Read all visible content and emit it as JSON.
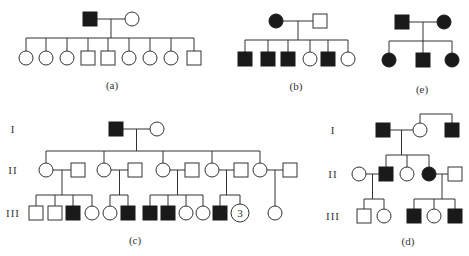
{
  "figure": {
    "panels": [
      {
        "id": "a",
        "label": "(a)",
        "generations": [
          {
            "label": "",
            "individuals": [
              {
                "sex": "male",
                "affected": true
              },
              {
                "sex": "female",
                "affected": false
              }
            ]
          },
          {
            "label": "",
            "individuals": [
              {
                "sex": "female",
                "affected": false
              },
              {
                "sex": "female",
                "affected": false
              },
              {
                "sex": "female",
                "affected": false
              },
              {
                "sex": "male",
                "affected": false
              },
              {
                "sex": "male",
                "affected": false
              },
              {
                "sex": "female",
                "affected": false
              },
              {
                "sex": "female",
                "affected": false
              },
              {
                "sex": "female",
                "affected": false
              },
              {
                "sex": "male",
                "affected": false
              }
            ]
          }
        ]
      },
      {
        "id": "b",
        "label": "(b)",
        "generations": [
          {
            "label": "",
            "individuals": [
              {
                "sex": "female",
                "affected": true
              },
              {
                "sex": "male",
                "affected": false
              }
            ]
          },
          {
            "label": "",
            "individuals": [
              {
                "sex": "male",
                "affected": true
              },
              {
                "sex": "male",
                "affected": true
              },
              {
                "sex": "male",
                "affected": true
              },
              {
                "sex": "female",
                "affected": false
              },
              {
                "sex": "male",
                "affected": true
              },
              {
                "sex": "female",
                "affected": false
              }
            ]
          }
        ]
      },
      {
        "id": "e",
        "label": "(e)",
        "generations": [
          {
            "label": "",
            "individuals": [
              {
                "sex": "male",
                "affected": true
              },
              {
                "sex": "female",
                "affected": true
              }
            ]
          },
          {
            "label": "",
            "individuals": [
              {
                "sex": "female",
                "affected": true
              },
              {
                "sex": "male",
                "affected": true
              },
              {
                "sex": "female",
                "affected": true
              }
            ]
          }
        ]
      },
      {
        "id": "c",
        "label": "(c)",
        "generation_labels": [
          "I",
          "II",
          "III"
        ],
        "gen1": [
          {
            "sex": "male",
            "affected": true
          },
          {
            "sex": "female",
            "affected": false
          }
        ],
        "gen2_couples": [
          {
            "child": {
              "sex": "female",
              "affected": false
            },
            "spouse": {
              "sex": "male",
              "affected": false
            },
            "children": [
              {
                "sex": "male",
                "affected": false
              },
              {
                "sex": "male",
                "affected": false
              },
              {
                "sex": "male",
                "affected": true
              },
              {
                "sex": "female",
                "affected": false
              }
            ]
          },
          {
            "child": {
              "sex": "female",
              "affected": false
            },
            "spouse": {
              "sex": "male",
              "affected": false
            },
            "children": [
              {
                "sex": "female",
                "affected": false
              },
              {
                "sex": "male",
                "affected": true
              }
            ]
          },
          {
            "child": {
              "sex": "female",
              "affected": false
            },
            "spouse": {
              "sex": "male",
              "affected": false
            },
            "children": [
              {
                "sex": "male",
                "affected": true
              },
              {
                "sex": "male",
                "affected": true
              },
              {
                "sex": "female",
                "affected": false
              },
              {
                "sex": "female",
                "affected": false
              }
            ]
          },
          {
            "child": {
              "sex": "female",
              "affected": false
            },
            "spouse": {
              "sex": "male",
              "affected": false
            },
            "children": [
              {
                "sex": "male",
                "affected": true
              },
              {
                "sex": "female",
                "affected": false,
                "count": "3"
              }
            ]
          },
          {
            "child": {
              "sex": "female",
              "affected": false
            },
            "spouse": {
              "sex": "male",
              "affected": false
            },
            "children": [
              {
                "sex": "female",
                "affected": false
              }
            ]
          }
        ]
      },
      {
        "id": "d",
        "label": "(d)",
        "generation_labels": [
          "I",
          "II",
          "III"
        ],
        "gen1": [
          {
            "sex": "male",
            "affected": true
          },
          {
            "sex": "female",
            "affected": false
          },
          {
            "sex": "male",
            "affected": true,
            "relation": "brother of female"
          }
        ],
        "gen2": [
          {
            "sex": "female",
            "affected": false,
            "relation": "spouse"
          },
          {
            "sex": "male",
            "affected": true
          },
          {
            "sex": "female",
            "affected": false
          },
          {
            "sex": "female",
            "affected": true
          },
          {
            "sex": "male",
            "affected": false,
            "relation": "spouse"
          }
        ],
        "gen3": [
          {
            "sex": "male",
            "affected": false
          },
          {
            "sex": "female",
            "affected": false
          },
          {
            "sex": "male",
            "affected": true
          },
          {
            "sex": "female",
            "affected": false
          },
          {
            "sex": "male",
            "affected": true
          }
        ]
      }
    ]
  }
}
